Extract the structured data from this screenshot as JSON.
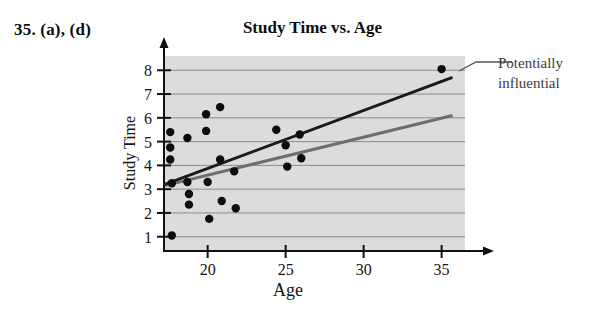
{
  "problem_label": "35. (a), (d)",
  "chart_data": {
    "type": "scatter",
    "title": "Study Time vs. Age",
    "xlabel": "Age",
    "ylabel": "Study Time",
    "xlim": [
      17.2,
      36.5
    ],
    "ylim": [
      0.4,
      8.6
    ],
    "xticks": [
      20,
      25,
      30,
      35
    ],
    "xtick_labels": [
      "20",
      "25",
      "30",
      "35"
    ],
    "yticks": [
      1,
      2,
      3,
      4,
      5,
      6,
      7,
      8
    ],
    "ytick_labels": [
      "1",
      "2",
      "3",
      "4",
      "5",
      "6",
      "7",
      "8"
    ],
    "grid": "horizontal",
    "plot_background": "#dcdcdc",
    "legend": "none",
    "points": [
      {
        "x": 17.6,
        "y": 5.4
      },
      {
        "x": 17.6,
        "y": 4.75
      },
      {
        "x": 17.6,
        "y": 4.25
      },
      {
        "x": 17.7,
        "y": 3.25
      },
      {
        "x": 17.7,
        "y": 1.05
      },
      {
        "x": 18.7,
        "y": 5.15
      },
      {
        "x": 18.7,
        "y": 3.3
      },
      {
        "x": 18.8,
        "y": 2.8
      },
      {
        "x": 18.8,
        "y": 2.35
      },
      {
        "x": 19.9,
        "y": 6.15
      },
      {
        "x": 19.9,
        "y": 5.45
      },
      {
        "x": 20.0,
        "y": 3.3
      },
      {
        "x": 20.1,
        "y": 1.75
      },
      {
        "x": 20.8,
        "y": 6.45
      },
      {
        "x": 20.8,
        "y": 4.25
      },
      {
        "x": 20.9,
        "y": 2.5
      },
      {
        "x": 21.7,
        "y": 3.75
      },
      {
        "x": 21.8,
        "y": 2.2
      },
      {
        "x": 24.4,
        "y": 5.5
      },
      {
        "x": 25.0,
        "y": 4.85
      },
      {
        "x": 25.1,
        "y": 3.95
      },
      {
        "x": 25.9,
        "y": 5.3
      },
      {
        "x": 26.0,
        "y": 4.3
      },
      {
        "x": 35.0,
        "y": 8.05
      }
    ],
    "lines": [
      {
        "name": "regression-with-influential-point",
        "color": "#1a1a1a",
        "width": 3,
        "x0": 17.25,
        "y0": 3.2,
        "x1": 35.7,
        "y1": 7.7
      },
      {
        "name": "regression-without-influential-point",
        "color": "#6e6e6e",
        "width": 3,
        "x0": 17.25,
        "y0": 3.15,
        "x1": 35.7,
        "y1": 6.1
      }
    ],
    "annotations": [
      {
        "name": "potentially-influential",
        "line1": "Potentially",
        "line2": "influential",
        "target_x": 35.0,
        "target_y": 8.05
      }
    ]
  }
}
